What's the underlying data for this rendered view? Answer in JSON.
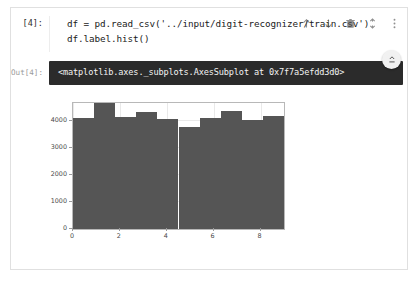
{
  "cell": {
    "input_prompt": "[4]:",
    "output_prompt": "Out[4]:",
    "code_lines": [
      {
        "pre": "df = pd.read_csv(",
        "str": "'../input/digit-recognizer/train.csv'",
        "post": ")"
      },
      {
        "pre": "df.label.hist",
        "str": "",
        "post": "()"
      }
    ],
    "code_line_1_plain": "df = pd.read_csv('../input/digit-recognizer/train.csv')",
    "code_line_2_plain": "df.label.hist()",
    "output_text": "<matplotlib.axes._subplots.AxesSubplot at 0x7f7a5efdd3d0>"
  },
  "toolbar": {
    "items": [
      {
        "name": "move-cell-up-icon",
        "label": "Move cell up"
      },
      {
        "name": "move-cell-down-icon",
        "label": "Move cell down"
      },
      {
        "name": "delete-cell-icon",
        "label": "Delete cell"
      },
      {
        "name": "collapse-cell-icon",
        "label": "Collapse"
      },
      {
        "name": "more-options-icon",
        "label": "More options"
      }
    ]
  },
  "output_controls": {
    "scroll_fab": "collapse-output-icon"
  },
  "colors": {
    "bar": "#555555",
    "output_bar_bg": "#2b2b2b",
    "output_bar_text": "#f2f2f2",
    "cell_border": "#e0e0e0",
    "axis": "#b8b8b8",
    "grid": "#e9e9e9"
  },
  "chart_data": {
    "type": "bar",
    "title": "",
    "xlabel": "",
    "ylabel": "",
    "categories": [
      "0",
      "1",
      "2",
      "3",
      "4",
      "5",
      "6",
      "7",
      "8",
      "9"
    ],
    "values": [
      4132,
      4684,
      4177,
      4351,
      4072,
      3795,
      4137,
      4401,
      4063,
      4188
    ],
    "xlim": [
      0,
      9
    ],
    "ylim": [
      0,
      4684
    ],
    "yticks": [
      0,
      1000,
      2000,
      3000,
      4000
    ],
    "ytick_labels": [
      "0",
      "1000",
      "2000",
      "3000",
      "4000"
    ],
    "xticks": [
      0,
      2,
      4,
      6,
      8
    ],
    "xtick_labels": [
      "0",
      "2",
      "4",
      "6",
      "8"
    ],
    "grid": true,
    "legend": null,
    "bin_edges": [
      0,
      0.9,
      1.8,
      2.7,
      3.6,
      4.5,
      5.4,
      6.3,
      7.2,
      8.1,
      9.0
    ]
  }
}
